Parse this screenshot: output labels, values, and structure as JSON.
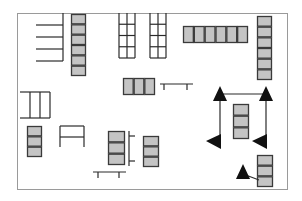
{
  "diagram": {
    "title": "",
    "colors": {
      "background": "#ffffff",
      "border": "#9a9a9a",
      "line": "#2a2a2a",
      "cell_fill": "#c4c4c4",
      "cell_stroke": "#3a3a3a",
      "arrow": "#111111"
    },
    "border": {
      "x": 17,
      "y": 13,
      "w": 270,
      "h": 176
    },
    "stacks": [
      {
        "name": "stack-top-left-vertical",
        "x": 71,
        "y": 14,
        "w": 15,
        "h": 62,
        "cells": 6,
        "orient": "v"
      },
      {
        "name": "stack-top-horizontal",
        "x": 183,
        "y": 26,
        "w": 65,
        "h": 17,
        "cells": 6,
        "orient": "h"
      },
      {
        "name": "stack-right-vertical",
        "x": 257,
        "y": 16,
        "w": 15,
        "h": 64,
        "cells": 6,
        "orient": "v"
      },
      {
        "name": "stack-middle-horizontal",
        "x": 123,
        "y": 78,
        "w": 32,
        "h": 17,
        "cells": 3,
        "orient": "h"
      },
      {
        "name": "stack-left-small",
        "x": 27,
        "y": 126,
        "w": 15,
        "h": 31,
        "cells": 3,
        "orient": "v"
      },
      {
        "name": "stack-center-lower",
        "x": 108,
        "y": 131,
        "w": 17,
        "h": 34,
        "cells": 3,
        "orient": "v"
      },
      {
        "name": "stack-center-right",
        "x": 143,
        "y": 136,
        "w": 16,
        "h": 31,
        "cells": 3,
        "orient": "v"
      },
      {
        "name": "stack-arrow-frame-inner",
        "x": 233,
        "y": 104,
        "w": 16,
        "h": 35,
        "cells": 3,
        "orient": "v"
      },
      {
        "name": "stack-bottom-right",
        "x": 257,
        "y": 155,
        "w": 16,
        "h": 32,
        "cells": 3,
        "orient": "v"
      }
    ],
    "grids": [
      {
        "name": "open-grid-left",
        "x": 119,
        "y": 13,
        "w": 16,
        "h": 45,
        "cols": 2,
        "rows": 4
      },
      {
        "name": "open-grid-right",
        "x": 150,
        "y": 13,
        "w": 16,
        "h": 45,
        "cols": 2,
        "rows": 4
      }
    ],
    "arrows": [
      {
        "name": "arrow-up-top-left",
        "x": 220,
        "y": 94,
        "dir": "up"
      },
      {
        "name": "arrow-up-top-right",
        "x": 266,
        "y": 94,
        "dir": "up"
      },
      {
        "name": "arrow-left-bottom-left",
        "x": 220,
        "y": 143,
        "dir": "left"
      },
      {
        "name": "arrow-left-bottom-right",
        "x": 266,
        "y": 143,
        "dir": "left"
      },
      {
        "name": "arrow-up-bottom",
        "x": 243,
        "y": 172,
        "dir": "up"
      }
    ]
  }
}
